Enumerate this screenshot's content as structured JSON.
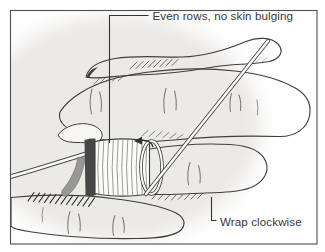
{
  "figure": {
    "type": "medical-illustration",
    "annotations": {
      "even_rows": "Even rows, no skin bulging",
      "wrap_clockwise": "Wrap clockwise"
    },
    "icons": {
      "clockwise_arrow": "clockwise-arrow-icon"
    },
    "colors": {
      "frame": "#4f4f4f",
      "outline": "#3f3f3f",
      "text": "#383838",
      "callout_line": "#333333",
      "skin_base": "#f5f4f2",
      "skin_stripe": "#eae8e5",
      "background_wash": "#ebe9e6",
      "wrap_fill": "#fbfbfa",
      "wrap_ridge": "#909090",
      "wrap_edge_dark": "#474747",
      "wrap_edge_gray": "#989898",
      "strand_fill": "#fbfbfa"
    }
  }
}
